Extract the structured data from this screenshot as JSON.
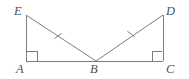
{
  "figure": {
    "type": "geometry-diagram",
    "canvas": {
      "width": 189,
      "height": 79
    },
    "colors": {
      "background": "#ffffff",
      "stroke": "#7d7d7d",
      "label": "#4f4f4f"
    },
    "stroke_width": 1,
    "points": {
      "A": {
        "x": 26,
        "y": 61,
        "label": "A"
      },
      "B": {
        "x": 96,
        "y": 61,
        "label": "B"
      },
      "C": {
        "x": 163,
        "y": 61,
        "label": "C"
      },
      "D": {
        "x": 163,
        "y": 15,
        "label": "D"
      },
      "E": {
        "x": 26,
        "y": 15,
        "label": "E"
      }
    },
    "labels": [
      {
        "text": "E",
        "x": 14,
        "y": 5,
        "name": "vertex-label-e"
      },
      {
        "text": "D",
        "x": 166,
        "y": 5,
        "name": "vertex-label-d"
      },
      {
        "text": "A",
        "x": 16,
        "y": 63,
        "name": "vertex-label-a"
      },
      {
        "text": "B",
        "x": 90,
        "y": 63,
        "name": "vertex-label-b"
      },
      {
        "text": "C",
        "x": 166,
        "y": 63,
        "name": "vertex-label-c"
      }
    ],
    "segments": [
      {
        "name": "segment-ea",
        "from": "E",
        "to": "A"
      },
      {
        "name": "segment-ac",
        "from": "A",
        "to": "C"
      },
      {
        "name": "segment-dc",
        "from": "D",
        "to": "C"
      },
      {
        "name": "segment-eb",
        "from": "E",
        "to": "B",
        "ticks": 1
      },
      {
        "name": "segment-bd",
        "from": "B",
        "to": "D",
        "ticks": 1
      }
    ],
    "right_angles": [
      {
        "name": "right-angle-a",
        "at": "A",
        "size": 10
      },
      {
        "name": "right-angle-c",
        "at": "C",
        "size": 10
      }
    ],
    "congruence_ticks": [
      {
        "name": "tick-mark-eb",
        "on": "segment-eb",
        "cx": 58,
        "cy": 36,
        "length": 9
      },
      {
        "name": "tick-mark-bd",
        "on": "segment-bd",
        "cx": 131,
        "cy": 34,
        "length": 9
      }
    ]
  }
}
